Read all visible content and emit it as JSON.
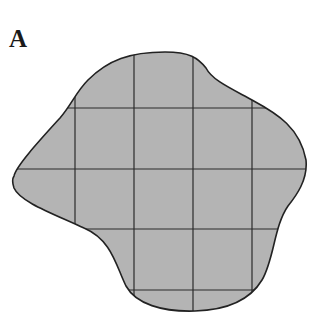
{
  "figure": {
    "panel_label": "A",
    "fill_color": "#b4b4b4",
    "stroke_color": "#222222",
    "grid_lines": {
      "vertical_x": [
        75,
        134,
        193,
        252
      ],
      "horizontal_y": [
        108,
        169,
        229,
        290
      ]
    }
  }
}
